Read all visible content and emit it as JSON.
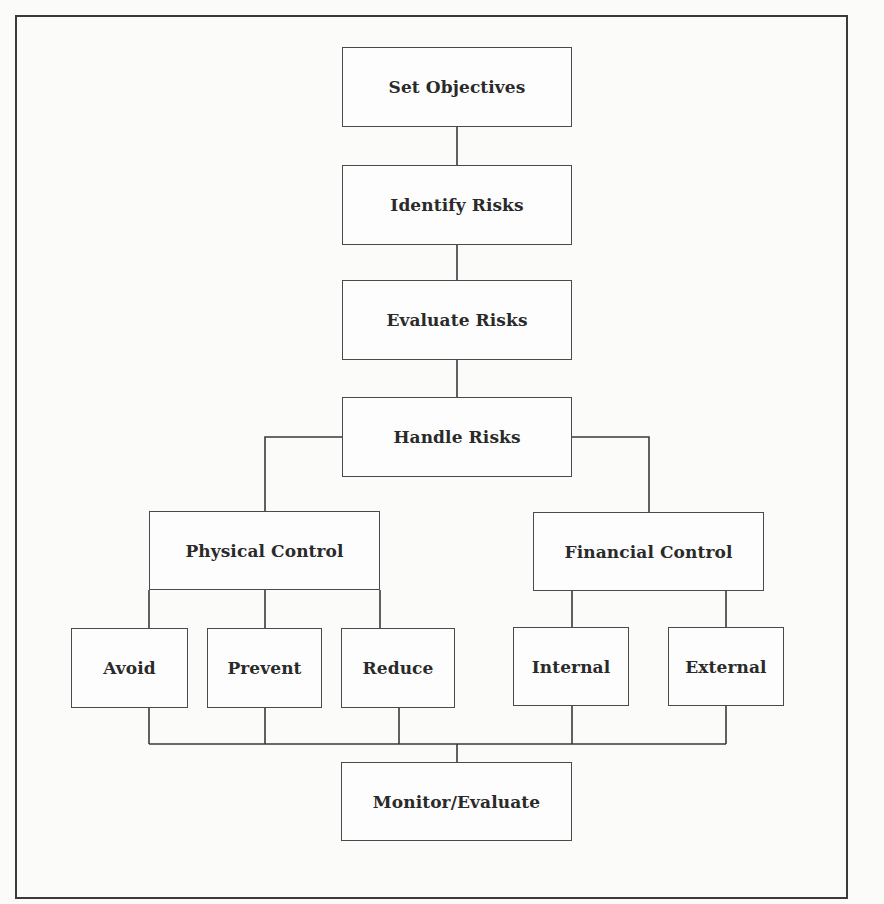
{
  "figure": {
    "nodes": {
      "set_objectives": "Set Objectives",
      "identify_risks": "Identify Risks",
      "evaluate_risks": "Evaluate Risks",
      "handle_risks": "Handle Risks",
      "physical_control": "Physical Control",
      "financial_control": "Financial Control",
      "avoid": "Avoid",
      "prevent": "Prevent",
      "reduce": "Reduce",
      "internal": "Internal",
      "external": "External",
      "monitor_evaluate": "Monitor/Evaluate"
    },
    "edges": [
      [
        "Set Objectives",
        "Identify Risks"
      ],
      [
        "Identify Risks",
        "Evaluate Risks"
      ],
      [
        "Evaluate Risks",
        "Handle Risks"
      ],
      [
        "Handle Risks",
        "Physical Control"
      ],
      [
        "Handle Risks",
        "Financial Control"
      ],
      [
        "Physical Control",
        "Avoid"
      ],
      [
        "Physical Control",
        "Prevent"
      ],
      [
        "Physical Control",
        "Reduce"
      ],
      [
        "Financial Control",
        "Internal"
      ],
      [
        "Financial Control",
        "External"
      ],
      [
        "Avoid",
        "Monitor/Evaluate"
      ],
      [
        "Prevent",
        "Monitor/Evaluate"
      ],
      [
        "Reduce",
        "Monitor/Evaluate"
      ],
      [
        "Internal",
        "Monitor/Evaluate"
      ],
      [
        "External",
        "Monitor/Evaluate"
      ]
    ],
    "colors": {
      "line": "#3a3a3a",
      "background": "#fbfbfa",
      "text": "#2a2a2a"
    }
  }
}
